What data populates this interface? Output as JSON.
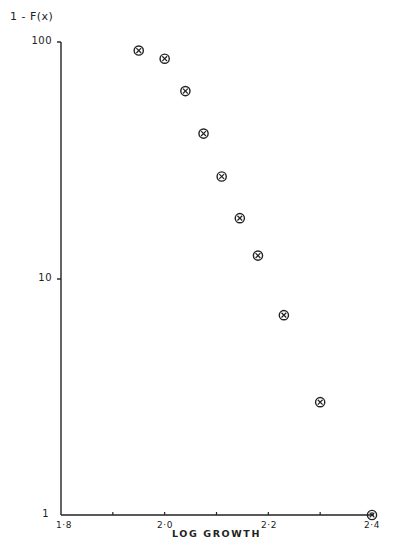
{
  "chart_data": {
    "type": "scatter",
    "title": "",
    "xlabel": "LOG GROWTH",
    "ylabel": "1 - F(x)",
    "xscale": "linear",
    "yscale": "log",
    "xlim": [
      1.8,
      2.4
    ],
    "ylim": [
      1,
      100
    ],
    "grid": false,
    "legend": null,
    "marker": "circled-x",
    "x_tick_labels": [
      "1·8",
      "2·0",
      "2·2",
      "2·4"
    ],
    "x_ticks": [
      1.8,
      1.9,
      2.0,
      2.1,
      2.2,
      2.3,
      2.4
    ],
    "y_tick_labels": [
      "1",
      "10",
      "100"
    ],
    "y_ticks": [
      1,
      10,
      100
    ],
    "series": [
      {
        "name": "1 - F(x)",
        "x": [
          1.95,
          2.0,
          2.04,
          2.075,
          2.11,
          2.145,
          2.18,
          2.23,
          2.3,
          2.4
        ],
        "y": [
          92,
          85,
          62,
          41,
          27,
          18,
          12.5,
          7,
          3,
          1
        ]
      }
    ]
  },
  "labels": {
    "ylabel": "1 - F(x)",
    "xlabel": "LOG GROWTH",
    "y_100": "100",
    "y_10": "10",
    "y_1": "1",
    "x_18": "1·8",
    "x_20": "2·0",
    "x_22": "2·2",
    "x_24": "2·4"
  }
}
